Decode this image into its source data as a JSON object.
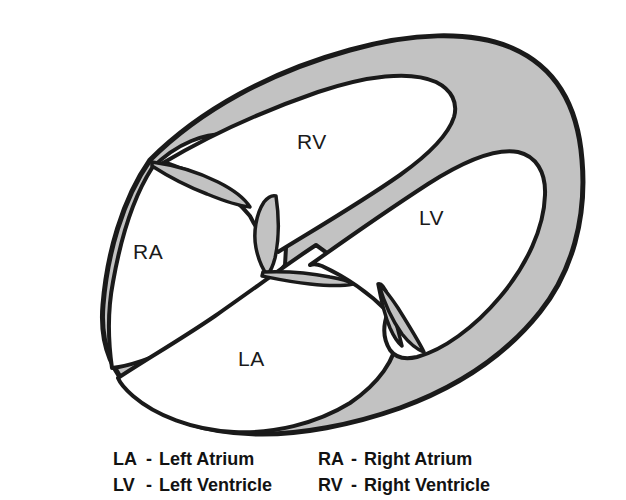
{
  "diagram": {
    "colors": {
      "outline": "#1a1a1a",
      "myocardium_fill": "#c2c2c2",
      "cavity_fill": "#ffffff",
      "background": "#ffffff",
      "label_text": "#1a1a1a",
      "legend_text": "#121212"
    },
    "chamber_labels": [
      {
        "id": "rv",
        "text": "RV",
        "x": 297,
        "y": 130
      },
      {
        "id": "ra",
        "text": "RA",
        "x": 133,
        "y": 240
      },
      {
        "id": "lv",
        "text": "LV",
        "x": 419,
        "y": 206
      },
      {
        "id": "la",
        "text": "LA",
        "x": 238,
        "y": 347
      }
    ],
    "structures": [
      {
        "id": "left-ventricle-wall",
        "name": "left ventricular myocardium",
        "fill": "#c2c2c2"
      },
      {
        "id": "right-ventricle-cavity",
        "name": "right ventricular cavity",
        "fill": "#ffffff"
      },
      {
        "id": "left-ventricle-cavity",
        "name": "left ventricular cavity",
        "fill": "#ffffff"
      },
      {
        "id": "right-atrium-cavity",
        "name": "right atrial cavity",
        "fill": "#ffffff"
      },
      {
        "id": "left-atrium-cavity",
        "name": "left atrial cavity",
        "fill": "#ffffff"
      },
      {
        "id": "interventricular-septum",
        "name": "interventricular septum",
        "fill": "#c2c2c2"
      },
      {
        "id": "tricuspid-valve",
        "name": "tricuspid valve leaflets",
        "fill": "#c2c2c2"
      },
      {
        "id": "mitral-valve",
        "name": "mitral valve leaflets",
        "fill": "#c2c2c2"
      },
      {
        "id": "atrial-septum",
        "name": "interatrial septum",
        "fill": "#c2c2c2"
      }
    ]
  },
  "legend": {
    "rows": [
      {
        "left": {
          "abbr": "LA",
          "dash": "-",
          "term": "Left Atrium"
        },
        "right": {
          "abbr": "RA",
          "dash": "-",
          "term": "Right Atrium"
        }
      },
      {
        "left": {
          "abbr": "LV",
          "dash": "-",
          "term": "Left Ventricle"
        },
        "right": {
          "abbr": "RV",
          "dash": "-",
          "term": "Right Ventricle"
        }
      }
    ]
  }
}
